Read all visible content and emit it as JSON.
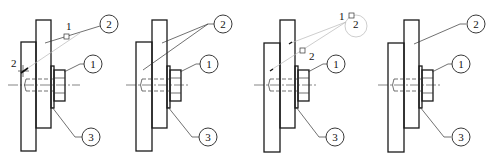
{
  "diagram": {
    "type": "bolted-plate-assembly-annotation-sequence",
    "panel_count": 4,
    "colors": {
      "line": "#1a1a1a",
      "guide": "#b8b8b8",
      "background": "#ffffff"
    },
    "panels": [
      {
        "id": "panel-1",
        "balloons": [
          {
            "number": "2"
          },
          {
            "number": "1"
          },
          {
            "number": "3"
          }
        ],
        "annotations": [
          {
            "text": "1",
            "note": "label near square marker"
          },
          {
            "text": "2",
            "note": "label near cross marker at left"
          }
        ]
      },
      {
        "id": "panel-2",
        "balloons": [
          {
            "number": "2"
          },
          {
            "number": "1"
          },
          {
            "number": "3"
          }
        ],
        "annotations": []
      },
      {
        "id": "panel-3",
        "balloons": [
          {
            "number": "1"
          },
          {
            "number": "3"
          }
        ],
        "annotations": [
          {
            "text": "1",
            "note": "label near top square marker"
          },
          {
            "text": "2",
            "note": "inside faint circle"
          },
          {
            "text": "2",
            "note": "label near lower square marker"
          }
        ]
      },
      {
        "id": "panel-4",
        "balloons": [
          {
            "number": "2"
          },
          {
            "number": "1"
          },
          {
            "number": "3"
          }
        ],
        "annotations": []
      }
    ]
  }
}
